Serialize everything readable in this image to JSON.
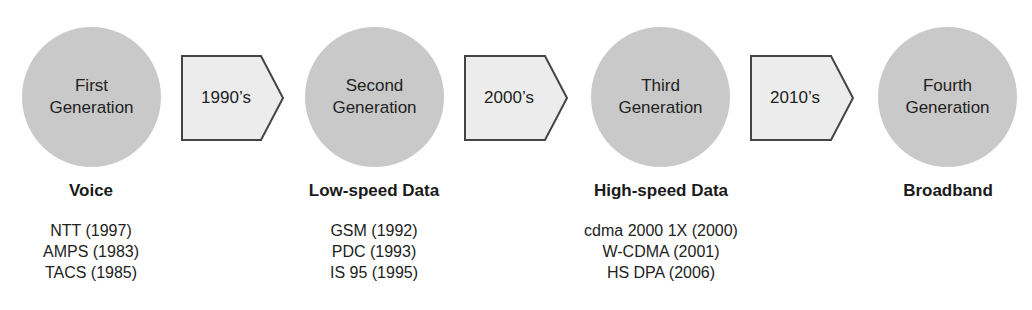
{
  "diagram": {
    "generations": [
      {
        "name_line1": "First",
        "name_line2": "Generation",
        "heading": "Voice",
        "technologies": [
          "NTT (1997)",
          "AMPS (1983)",
          "TACS (1985)"
        ]
      },
      {
        "name_line1": "Second",
        "name_line2": "Generation",
        "heading": "Low-speed Data",
        "technologies": [
          "GSM (1992)",
          "PDC (1993)",
          "IS 95 (1995)"
        ]
      },
      {
        "name_line1": "Third",
        "name_line2": "Generation",
        "heading": "High-speed Data",
        "technologies": [
          "cdma 2000 1X (2000)",
          "W-CDMA (2001)",
          "HS DPA (2006)"
        ]
      },
      {
        "name_line1": "Fourth",
        "name_line2": "Generation",
        "heading": "Broadband",
        "technologies": []
      }
    ],
    "transitions": [
      {
        "label": "1990’s"
      },
      {
        "label": "2000’s"
      },
      {
        "label": "2010’s"
      }
    ],
    "colors": {
      "circle_fill": "#c9c9c9",
      "arrow_fill": "#ececec",
      "arrow_stroke": "#444444"
    }
  }
}
